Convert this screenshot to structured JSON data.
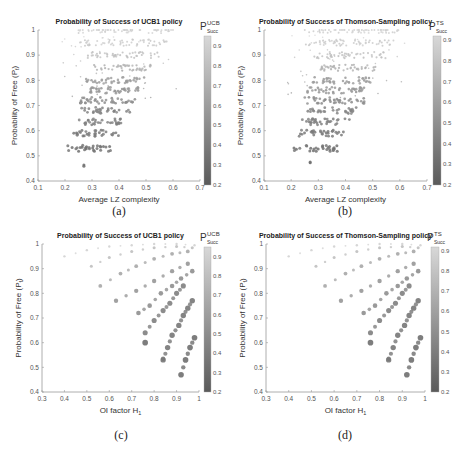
{
  "figure": {
    "captions": [
      "(a)",
      "(b)",
      "(c)",
      "(d)"
    ]
  },
  "chart_data": [
    {
      "id": "a",
      "type": "scatter",
      "title": "Probability of Success of UCB1 policy",
      "xlabel": "Average LZ complexity",
      "ylabel": "Probability of Free (P_f)",
      "xlim": [
        0.1,
        0.7
      ],
      "ylim": [
        0.4,
        1.0
      ],
      "xticks": [
        "0.1",
        "0.2",
        "0.3",
        "0.4",
        "0.5",
        "0.6",
        "0.7"
      ],
      "yticks": [
        "0.4",
        "0.5",
        "0.6",
        "0.7",
        "0.8",
        "0.9",
        "1"
      ],
      "colorbar": {
        "label": "P",
        "sup": "UCB",
        "sub": "Succ",
        "range": [
          0.2,
          0.95
        ],
        "ticks": [
          "0.2",
          "0.3",
          "0.4",
          "0.5",
          "0.6",
          "0.7",
          "0.8",
          "0.9"
        ]
      },
      "grid": false,
      "description": "Dense cloud of points; high P_f (~1) near x 0.25-0.6 with light colors (P_succ~0.9); lower P_f bands (0.53-0.8) concentrated at x 0.2-0.45 with darker colors",
      "bands": [
        {
          "y": 1.0,
          "x_range": [
            0.25,
            0.6
          ],
          "color_value": 0.92
        },
        {
          "y": 0.95,
          "x_range": [
            0.25,
            0.58
          ],
          "color_value": 0.88
        },
        {
          "y": 0.9,
          "x_range": [
            0.28,
            0.55
          ],
          "color_value": 0.82
        },
        {
          "y": 0.85,
          "x_range": [
            0.3,
            0.52
          ],
          "color_value": 0.72
        },
        {
          "y": 0.8,
          "x_range": [
            0.27,
            0.5
          ],
          "color_value": 0.6
        },
        {
          "y": 0.76,
          "x_range": [
            0.26,
            0.48
          ],
          "color_value": 0.55
        },
        {
          "y": 0.72,
          "x_range": [
            0.25,
            0.47
          ],
          "color_value": 0.5
        },
        {
          "y": 0.68,
          "x_range": [
            0.26,
            0.44
          ],
          "color_value": 0.45
        },
        {
          "y": 0.635,
          "x_range": [
            0.24,
            0.42
          ],
          "color_value": 0.42
        },
        {
          "y": 0.59,
          "x_range": [
            0.22,
            0.4
          ],
          "color_value": 0.38
        },
        {
          "y": 0.53,
          "x_range": [
            0.21,
            0.37
          ],
          "color_value": 0.33
        },
        {
          "y": 0.47,
          "x_range": [
            0.27,
            0.27
          ],
          "color_value": 0.3
        }
      ]
    },
    {
      "id": "b",
      "type": "scatter",
      "title": "Probability of Success of Thomson-Sampling policy",
      "xlabel": "Average LZ complexity",
      "ylabel": "Probability of Free (P_f)",
      "xlim": [
        0.1,
        0.7
      ],
      "ylim": [
        0.4,
        1.0
      ],
      "xticks": [
        "0.1",
        "0.2",
        "0.3",
        "0.4",
        "0.5",
        "0.6",
        "0.7"
      ],
      "yticks": [
        "0.4",
        "0.5",
        "0.6",
        "0.7",
        "0.8",
        "0.9",
        "1"
      ],
      "colorbar": {
        "label": "P",
        "sup": "TS",
        "sub": "Succ",
        "range": [
          0.2,
          0.92
        ],
        "ticks": [
          "0.2",
          "0.3",
          "0.4",
          "0.5",
          "0.6",
          "0.7",
          "0.8",
          "0.9"
        ]
      },
      "grid": false,
      "description": "Nearly identical distribution to (a)"
    },
    {
      "id": "c",
      "type": "scatter",
      "title": "Probability of Success of UCB1 policy",
      "xlabel": "OI factor H_1",
      "ylabel": "Probability of Free (P_f)",
      "xlim": [
        0.3,
        1.0
      ],
      "ylim": [
        0.4,
        1.0
      ],
      "xticks": [
        "0.3",
        "0.4",
        "0.5",
        "0.6",
        "0.7",
        "0.8",
        "0.9",
        "1"
      ],
      "yticks": [
        "0.4",
        "0.5",
        "0.6",
        "0.7",
        "0.8",
        "0.9",
        "1"
      ],
      "colorbar": {
        "label": "P",
        "sup": "UCB",
        "sub": "Succ",
        "range": [
          0.2,
          0.95
        ],
        "ticks": [
          "0.2",
          "0.3",
          "0.4",
          "0.5",
          "0.6",
          "0.7",
          "0.8",
          "0.9"
        ]
      },
      "grid": false,
      "description": "Points lie on several concave curves fanning from upper-left to lower-right; darker/larger markers at high H1 and lower P_f",
      "curves": [
        {
          "points": [
            [
              0.4,
              0.95
            ],
            [
              0.5,
              0.975
            ],
            [
              0.6,
              0.99
            ],
            [
              0.7,
              0.995
            ],
            [
              0.8,
              1.0
            ],
            [
              0.9,
              1.0
            ],
            [
              0.98,
              0.995
            ]
          ],
          "color_value": 0.92
        },
        {
          "points": [
            [
              0.52,
              0.91
            ],
            [
              0.6,
              0.945
            ],
            [
              0.7,
              0.97
            ],
            [
              0.8,
              0.985
            ],
            [
              0.9,
              0.99
            ],
            [
              0.97,
              0.985
            ]
          ],
          "color_value": 0.8
        },
        {
          "points": [
            [
              0.56,
              0.83
            ],
            [
              0.65,
              0.88
            ],
            [
              0.72,
              0.91
            ],
            [
              0.8,
              0.94
            ],
            [
              0.88,
              0.96
            ],
            [
              0.95,
              0.97
            ]
          ],
          "color_value": 0.65
        },
        {
          "points": [
            [
              0.63,
              0.77
            ],
            [
              0.72,
              0.81
            ],
            [
              0.8,
              0.85
            ],
            [
              0.88,
              0.89
            ],
            [
              0.95,
              0.92
            ]
          ],
          "color_value": 0.55
        },
        {
          "points": [
            [
              0.73,
              0.72
            ],
            [
              0.78,
              0.75
            ],
            [
              0.83,
              0.8
            ],
            [
              0.88,
              0.83
            ],
            [
              0.92,
              0.86
            ],
            [
              0.97,
              0.89
            ]
          ],
          "color_value": 0.5
        },
        {
          "points": [
            [
              0.76,
              0.64
            ],
            [
              0.8,
              0.69
            ],
            [
              0.84,
              0.73
            ],
            [
              0.87,
              0.76
            ],
            [
              0.9,
              0.8
            ],
            [
              0.93,
              0.83
            ]
          ],
          "color_value": 0.4
        },
        {
          "points": [
            [
              0.84,
              0.53
            ],
            [
              0.86,
              0.58
            ],
            [
              0.88,
              0.63
            ],
            [
              0.91,
              0.67
            ],
            [
              0.93,
              0.71
            ],
            [
              0.95,
              0.74
            ],
            [
              0.97,
              0.77
            ]
          ],
          "color_value": 0.35
        },
        {
          "points": [
            [
              0.76,
              0.6
            ],
            [
              0.92,
              0.47
            ],
            [
              0.94,
              0.53
            ],
            [
              0.96,
              0.58
            ],
            [
              0.98,
              0.62
            ]
          ],
          "color_value": 0.3
        }
      ]
    },
    {
      "id": "d",
      "type": "scatter",
      "title": "Probability of Success of Thomson-Sampling policy",
      "xlabel": "OI factor H_1",
      "ylabel": "Probability of Free (P_f)",
      "xlim": [
        0.3,
        1.0
      ],
      "ylim": [
        0.4,
        1.0
      ],
      "xticks": [
        "0.3",
        "0.4",
        "0.5",
        "0.6",
        "0.7",
        "0.8",
        "0.9",
        "1"
      ],
      "yticks": [
        "0.4",
        "0.5",
        "0.6",
        "0.7",
        "0.8",
        "0.9",
        "1"
      ],
      "colorbar": {
        "label": "P",
        "sup": "TS",
        "sub": "Succ",
        "range": [
          0.2,
          0.92
        ],
        "ticks": [
          "0.2",
          "0.3",
          "0.4",
          "0.5",
          "0.6",
          "0.7",
          "0.8",
          "0.9"
        ]
      },
      "grid": false,
      "description": "Nearly identical distribution to (c)"
    }
  ]
}
